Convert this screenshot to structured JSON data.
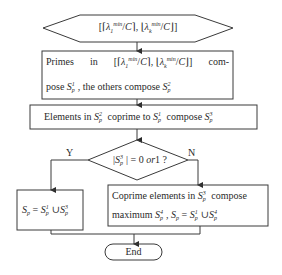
{
  "diagram": {
    "title": "",
    "nodes": {
      "start": {
        "shape": "hexagon",
        "text": "[⌈λ₁ᵐⁱⁿ/C⌉, ⌊λₖᵐⁱⁿ/C⌋]"
      },
      "step1": {
        "shape": "rectangle",
        "line1_words": [
          "Primes",
          "in",
          "[⌈λ₁ᵐⁱⁿ/C⌉, ⌊λₖᵐⁱⁿ/C⌋]",
          "com-"
        ],
        "line2": "pose S¹ₚ , the others compose S²ₚ"
      },
      "step2": {
        "shape": "rectangle",
        "text": "Elements in S²ₚ coprime to S¹ₚ compose S³ₚ"
      },
      "decision": {
        "shape": "diamond",
        "text": "|S³ₚ| = 0 or1 ?"
      },
      "yes_box": {
        "shape": "rectangle",
        "text": "Sₚ = S¹ₚ ∪ S³ₚ"
      },
      "no_box": {
        "shape": "rectangle",
        "line1": "Coprime elements in S³ₚ compose",
        "line2": "maximum S⁴ₚ , Sₚ = S¹ₚ ∪ S⁴ₚ"
      },
      "end": {
        "shape": "terminal",
        "text": "End"
      }
    },
    "branch_labels": {
      "yes": "Y",
      "no": "N"
    },
    "parts": {
      "primes": "Primes",
      "in": "in",
      "com": "com-",
      "pose": "pose",
      "the_others_compose": ", the others compose",
      "elements_in": "Elements in",
      "coprime_to": "coprime to",
      "compose": "compose",
      "eq_zero_or1": "= 0",
      "or1": "or",
      "one_q": "1 ?",
      "coprime_elements_in": "Coprime elements in",
      "maximum": "maximum",
      "S": "S",
      "p": "p",
      "sup1": "1",
      "sup2": "2",
      "sup3": "3",
      "sup4": "4",
      "eq": "=",
      "cup": "∪",
      "lambda": "λ",
      "sub1": "1",
      "subk": "k",
      "min": "min",
      "C": "C",
      "end": "End"
    },
    "colors": {
      "stroke": "#3a3a3a",
      "text": "#2a2a2a",
      "background": "#ffffff"
    }
  }
}
